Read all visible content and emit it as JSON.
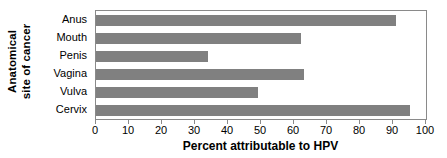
{
  "chart_data": {
    "type": "bar",
    "orientation": "horizontal",
    "title": "",
    "xlabel": "Percent attributable to HPV",
    "ylabel": "Anatomical site of cancer",
    "ylabel_lines": [
      "Anatomical",
      "site of cancer"
    ],
    "categories": [
      "Anus",
      "Mouth",
      "Penis",
      "Vagina",
      "Vulva",
      "Cervix"
    ],
    "values": [
      91,
      62,
      34,
      63,
      49,
      95
    ],
    "xlim": [
      0,
      100
    ],
    "xticks": [
      0,
      10,
      20,
      30,
      40,
      50,
      60,
      70,
      80,
      90,
      100
    ],
    "xtick_labels": [
      "0",
      "10",
      "20",
      "30",
      "40",
      "50",
      "60",
      "70",
      "80",
      "90",
      "100"
    ],
    "grid": false,
    "legend": false,
    "bar_color": "#808080",
    "frame_color": "#8a8a8a",
    "background_color": "#ffffff"
  }
}
